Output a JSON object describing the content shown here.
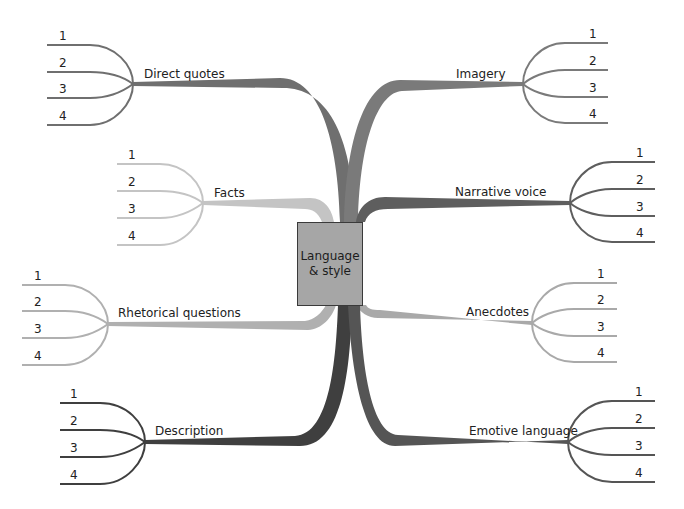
{
  "center": {
    "line1": "Language",
    "line2": "& style",
    "fill": "#a6a6a6"
  },
  "branches": [
    {
      "id": "direct-quotes",
      "label": "Direct quotes",
      "side": "left",
      "color": "#6f6f6f",
      "items": [
        "1",
        "2",
        "3",
        "4"
      ]
    },
    {
      "id": "imagery",
      "label": "Imagery",
      "side": "right",
      "color": "#7a7a7a",
      "items": [
        "1",
        "2",
        "3",
        "4"
      ]
    },
    {
      "id": "facts",
      "label": "Facts",
      "side": "left",
      "color": "#c4c4c4",
      "items": [
        "1",
        "2",
        "3",
        "4"
      ]
    },
    {
      "id": "narrative-voice",
      "label": "Narrative voice",
      "side": "right",
      "color": "#5e5e5e",
      "items": [
        "1",
        "2",
        "3",
        "4"
      ]
    },
    {
      "id": "rhetorical-questions",
      "label": "Rhetorical questions",
      "side": "left",
      "color": "#b0b0b0",
      "items": [
        "1",
        "2",
        "3",
        "4"
      ]
    },
    {
      "id": "anecdotes",
      "label": "Anecdotes",
      "side": "right",
      "color": "#a9a9a9",
      "items": [
        "1",
        "2",
        "3",
        "4"
      ]
    },
    {
      "id": "description",
      "label": "Description",
      "side": "left",
      "color": "#3f3f3f",
      "items": [
        "1",
        "2",
        "3",
        "4"
      ]
    },
    {
      "id": "emotive-language",
      "label": "Emotive language",
      "side": "right",
      "color": "#555555",
      "items": [
        "1",
        "2",
        "3",
        "4"
      ]
    }
  ]
}
